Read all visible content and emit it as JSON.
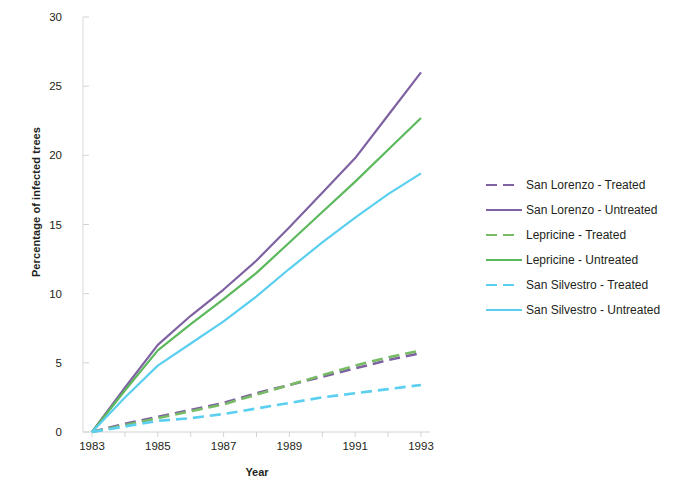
{
  "chart_data": {
    "type": "line",
    "title": "",
    "xlabel": "Year",
    "ylabel": "Percentage of infected trees",
    "x": [
      1983,
      1984,
      1985,
      1986,
      1987,
      1988,
      1989,
      1990,
      1991,
      1992,
      1993
    ],
    "xticks": [
      1983,
      1985,
      1987,
      1989,
      1991,
      1993
    ],
    "yticks": [
      0,
      5,
      10,
      15,
      20,
      25,
      30
    ],
    "xlim": [
      1983,
      1993
    ],
    "ylim": [
      0,
      30
    ],
    "grid": false,
    "legend_position": "right",
    "series": [
      {
        "name": "San Lorenzo - Treated",
        "color": "#7F62A1",
        "style": "dashed",
        "values": [
          0.0,
          0.6,
          1.1,
          1.6,
          2.1,
          2.8,
          3.4,
          4.0,
          4.6,
          5.2,
          5.7
        ]
      },
      {
        "name": "San Lorenzo - Untreated",
        "color": "#7F62A1",
        "style": "solid",
        "values": [
          0.0,
          3.2,
          6.3,
          8.4,
          10.3,
          12.4,
          14.8,
          17.3,
          19.8,
          22.9,
          26.0
        ]
      },
      {
        "name": "Lepricine - Treated",
        "color": "#77BC65",
        "style": "dashed",
        "values": [
          0.0,
          0.5,
          1.0,
          1.5,
          2.0,
          2.7,
          3.4,
          4.1,
          4.8,
          5.4,
          5.9
        ]
      },
      {
        "name": "Lepricine - Untreated",
        "color": "#5CB85C",
        "style": "solid",
        "values": [
          0.0,
          3.0,
          5.9,
          7.8,
          9.6,
          11.5,
          13.7,
          15.9,
          18.1,
          20.4,
          22.7
        ]
      },
      {
        "name": "San Silvestro - Treated",
        "color": "#5BCFEF",
        "style": "dashed",
        "values": [
          0.0,
          0.4,
          0.8,
          1.0,
          1.3,
          1.7,
          2.1,
          2.5,
          2.8,
          3.1,
          3.4
        ]
      },
      {
        "name": "San Silvestro - Untreated",
        "color": "#5BCFEF",
        "style": "solid",
        "values": [
          0.0,
          2.5,
          4.8,
          6.4,
          8.0,
          9.8,
          11.8,
          13.7,
          15.5,
          17.2,
          18.7
        ]
      }
    ]
  },
  "legend": {
    "items": [
      {
        "label": "San Lorenzo - Treated"
      },
      {
        "label": "San Lorenzo - Untreated"
      },
      {
        "label": "Lepricine - Treated"
      },
      {
        "label": "Lepricine - Untreated"
      },
      {
        "label": "San Silvestro - Treated"
      },
      {
        "label": "San Silvestro - Untreated"
      }
    ]
  },
  "axes": {
    "x_title": "Year",
    "y_title": "Percentage of infected trees",
    "y_tick_labels": [
      "0",
      "5",
      "10",
      "15",
      "20",
      "25",
      "30"
    ],
    "x_tick_labels": [
      "1983",
      "1985",
      "1987",
      "1989",
      "1991",
      "1993"
    ]
  }
}
